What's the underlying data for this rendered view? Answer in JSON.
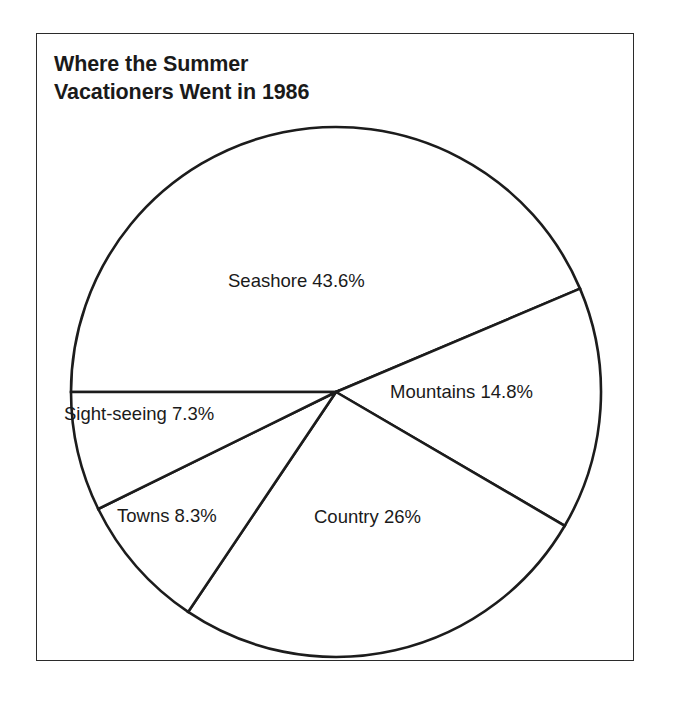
{
  "figure": {
    "title_line_1": "Where the Summer",
    "title_line_2": "Vacationers Went in 1986",
    "title_full": "Where the Summer\nVacationers Went in 1986",
    "frame_color": "#2b2b2b",
    "stroke_color": "#1c1c1c",
    "fill_color": "#ffffff"
  },
  "chart_data": {
    "type": "pie",
    "title": "Where the Summer Vacationers Went in 1986",
    "subtitle": "",
    "xlabel": "",
    "ylabel": "",
    "grid": false,
    "legend": "none",
    "labels_inside": true,
    "total_percent": 100,
    "categories": [
      "Seashore",
      "Mountains",
      "Country",
      "Towns",
      "Sight-seeing"
    ],
    "values": [
      43.6,
      14.8,
      26,
      8.3,
      7.3
    ],
    "slices": [
      {
        "name": "Seashore",
        "value": 43.6,
        "value_label": "43.6%",
        "label": "Seashore 43.6%",
        "label_x": 191,
        "label_y": 236,
        "start_angle_deg": 180,
        "end_angle_deg": 337.04,
        "fill": "#ffffff",
        "stroke": "#1c1c1c"
      },
      {
        "name": "Mountains",
        "value": 14.8,
        "value_label": "14.8%",
        "label": "Mountains 14.8%",
        "label_x": 353,
        "label_y": 347,
        "start_angle_deg": 337.04,
        "end_angle_deg": 390.32,
        "fill": "#ffffff",
        "stroke": "#1c1c1c"
      },
      {
        "name": "Country",
        "value": 26,
        "value_label": "26%",
        "label": "Country 26%",
        "label_x": 277,
        "label_y": 472,
        "start_angle_deg": 390.32,
        "end_angle_deg": 483.92,
        "fill": "#ffffff",
        "stroke": "#1c1c1c"
      },
      {
        "name": "Towns",
        "value": 8.3,
        "value_label": "8.3%",
        "label": "Towns 8.3%",
        "label_x": 80,
        "label_y": 471,
        "start_angle_deg": 483.92,
        "end_angle_deg": 513.8,
        "fill": "#ffffff",
        "stroke": "#1c1c1c"
      },
      {
        "name": "Sight-seeing",
        "value": 7.3,
        "value_label": "7.3%",
        "label": "Sight-seeing 7.3%",
        "label_x": 27,
        "label_y": 369,
        "start_angle_deg": 513.8,
        "end_angle_deg": 540,
        "fill": "#ffffff",
        "stroke": "#1c1c1c"
      }
    ],
    "geometry": {
      "center_x": 299,
      "center_y": 358,
      "radius": 265
    }
  }
}
